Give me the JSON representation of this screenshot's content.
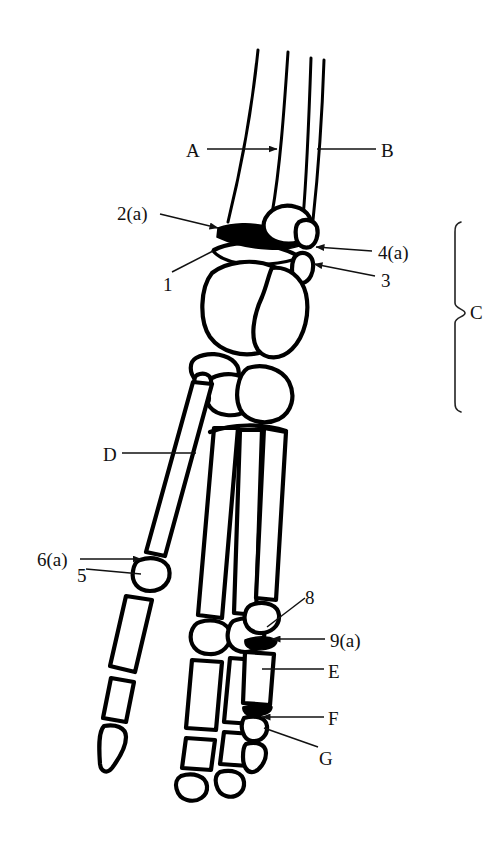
{
  "figure": {
    "type": "anatomical-line-diagram",
    "background_color": "#ffffff",
    "ink_color": "#000000",
    "width": 502,
    "height": 845
  },
  "labels": [
    {
      "id": "A",
      "text": "A",
      "text_x": 186,
      "text_y": 141,
      "side": "left",
      "leader": {
        "kind": "arrow",
        "x1": 207,
        "y1": 149,
        "x2": 277,
        "y2": 149
      }
    },
    {
      "id": "B",
      "text": "B",
      "text_x": 381,
      "text_y": 141,
      "side": "right",
      "leader": {
        "kind": "line",
        "x1": 376,
        "y1": 149,
        "x2": 317,
        "y2": 149
      }
    },
    {
      "id": "2a",
      "text": "2(a)",
      "text_x": 117,
      "text_y": 204,
      "side": "left",
      "leader": {
        "kind": "arrow",
        "x1": 160,
        "y1": 214,
        "x2": 218,
        "y2": 228
      }
    },
    {
      "id": "4a",
      "text": "4(a)",
      "text_x": 378,
      "text_y": 243,
      "side": "right",
      "leader": {
        "kind": "arrow",
        "x1": 372,
        "y1": 251,
        "x2": 316,
        "y2": 247
      }
    },
    {
      "id": "1",
      "text": "1",
      "text_x": 163,
      "text_y": 275,
      "side": "left",
      "leader": {
        "kind": "line",
        "x1": 172,
        "y1": 272,
        "x2": 213,
        "y2": 251
      }
    },
    {
      "id": "3",
      "text": "3",
      "text_x": 381,
      "text_y": 271,
      "side": "right",
      "leader": {
        "kind": "arrow",
        "x1": 375,
        "y1": 276,
        "x2": 314,
        "y2": 264
      }
    },
    {
      "id": "C",
      "text": "C",
      "text_x": 470,
      "text_y": 303,
      "side": "right",
      "leader": {
        "kind": "bracket",
        "x": 455,
        "y_top": 222,
        "y_bottom": 412,
        "tip_x": 465,
        "tip_y": 313
      }
    },
    {
      "id": "D",
      "text": "D",
      "text_x": 103,
      "text_y": 445,
      "side": "left",
      "leader": {
        "kind": "line",
        "x1": 122,
        "y1": 453,
        "x2": 196,
        "y2": 453
      }
    },
    {
      "id": "6a",
      "text": "6(a)",
      "text_x": 37,
      "text_y": 550,
      "side": "left",
      "leader": {
        "kind": "arrow",
        "x1": 80,
        "y1": 559,
        "x2": 141,
        "y2": 559
      }
    },
    {
      "id": "5",
      "text": "5",
      "text_x": 77,
      "text_y": 566,
      "side": "left",
      "leader": {
        "kind": "line",
        "x1": 86,
        "y1": 569,
        "x2": 141,
        "y2": 574
      }
    },
    {
      "id": "8",
      "text": "8",
      "text_x": 305,
      "text_y": 588,
      "side": "right",
      "leader": {
        "kind": "line",
        "x1": 305,
        "y1": 598,
        "x2": 267,
        "y2": 627
      }
    },
    {
      "id": "9a",
      "text": "9(a)",
      "text_x": 330,
      "text_y": 631,
      "side": "right",
      "leader": {
        "kind": "arrow",
        "x1": 325,
        "y1": 639,
        "x2": 272,
        "y2": 639
      }
    },
    {
      "id": "E",
      "text": "E",
      "text_x": 328,
      "text_y": 662,
      "side": "right",
      "leader": {
        "kind": "line",
        "x1": 324,
        "y1": 669,
        "x2": 262,
        "y2": 669
      }
    },
    {
      "id": "F",
      "text": "F",
      "text_x": 328,
      "text_y": 709,
      "side": "right",
      "leader": {
        "kind": "arrow",
        "x1": 324,
        "y1": 717,
        "x2": 262,
        "y2": 717
      }
    },
    {
      "id": "G",
      "text": "G",
      "text_x": 319,
      "text_y": 749,
      "side": "right",
      "leader": {
        "kind": "line",
        "x1": 318,
        "y1": 747,
        "x2": 264,
        "y2": 728
      }
    }
  ],
  "label_summary": {
    "letters": [
      "A",
      "B",
      "C",
      "D",
      "E",
      "F",
      "G"
    ],
    "numbers": [
      "1",
      "2(a)",
      "3",
      "4(a)",
      "5",
      "6(a)",
      "8",
      "9(a)"
    ],
    "total_count": 15
  }
}
